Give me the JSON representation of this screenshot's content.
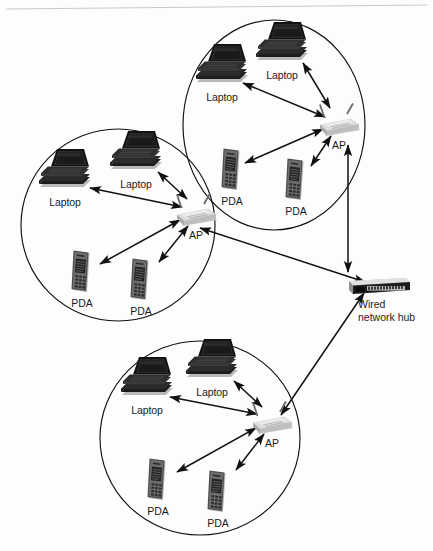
{
  "diagram": {
    "type": "network-topology",
    "background_color": "#fdfdfd",
    "stroke_color": "#111111",
    "label_color": "#1b1b1b",
    "cells": [
      {
        "id": "cell-top",
        "name": "top-wireless-cell",
        "cx": 274,
        "cy": 125,
        "rx": 91,
        "ry": 105,
        "access_point": {
          "name": "ap-top",
          "label": "AP",
          "x": 334,
          "y": 122
        },
        "clients": [
          {
            "name": "laptop-top-left",
            "type": "laptop",
            "label": "Laptop",
            "x": 217,
            "y": 70
          },
          {
            "name": "laptop-top-right",
            "type": "laptop",
            "label": "Laptop",
            "x": 277,
            "y": 48
          },
          {
            "name": "pda-top-left",
            "type": "pda",
            "label": "PDA",
            "x": 232,
            "y": 168
          },
          {
            "name": "pda-top-right",
            "type": "pda",
            "label": "PDA",
            "x": 296,
            "y": 178
          }
        ]
      },
      {
        "id": "cell-left",
        "name": "left-wireless-cell",
        "cx": 118,
        "cy": 225,
        "rx": 97,
        "ry": 96,
        "access_point": {
          "name": "ap-left",
          "label": "AP",
          "x": 191,
          "y": 212
        },
        "clients": [
          {
            "name": "laptop-left-outer",
            "type": "laptop",
            "label": "Laptop",
            "x": 60,
            "y": 175
          },
          {
            "name": "laptop-left-inner",
            "type": "laptop",
            "label": "Laptop",
            "x": 131,
            "y": 157
          },
          {
            "name": "pda-left-lower-left",
            "type": "pda",
            "label": "PDA",
            "x": 82,
            "y": 270
          },
          {
            "name": "pda-left-lower-right",
            "type": "pda",
            "label": "PDA",
            "x": 141,
            "y": 278
          }
        ]
      },
      {
        "id": "cell-bottom",
        "name": "bottom-wireless-cell",
        "cx": 200,
        "cy": 438,
        "rx": 100,
        "ry": 97,
        "access_point": {
          "name": "ap-bottom",
          "label": "AP",
          "x": 267,
          "y": 420
        },
        "clients": [
          {
            "name": "laptop-bottom-left",
            "type": "laptop",
            "label": "Laptop",
            "x": 142,
            "y": 383
          },
          {
            "name": "laptop-bottom-right",
            "type": "laptop",
            "label": "Laptop",
            "x": 207,
            "y": 365
          },
          {
            "name": "pda-bottom-left",
            "type": "pda",
            "label": "PDA",
            "x": 158,
            "y": 478
          },
          {
            "name": "pda-bottom-right",
            "type": "pda",
            "label": "PDA",
            "x": 218,
            "y": 490
          }
        ]
      }
    ],
    "hub": {
      "name": "wired-network-hub",
      "label_line1": "Wired",
      "label_line2": "network hub",
      "x": 379,
      "y": 285
    },
    "backbone_links": [
      {
        "name": "link-ap-top-to-hub",
        "from": "ap-top",
        "to": "wired-network-hub",
        "bidirectional": true
      },
      {
        "name": "link-ap-left-to-hub",
        "from": "ap-left",
        "to": "wired-network-hub",
        "bidirectional": true
      },
      {
        "name": "link-ap-bottom-to-hub",
        "from": "ap-bottom",
        "to": "wired-network-hub",
        "bidirectional": true
      }
    ]
  }
}
